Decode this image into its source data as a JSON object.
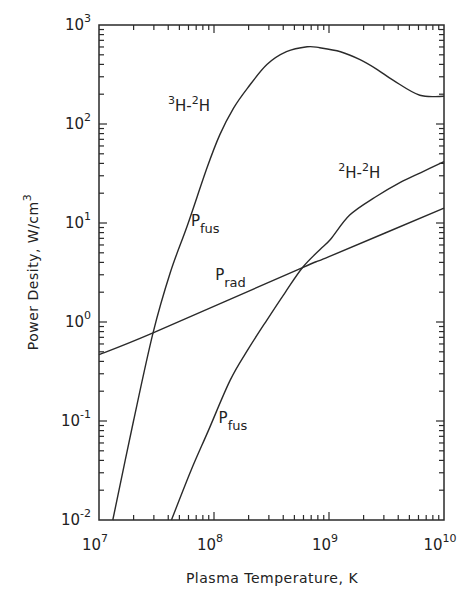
{
  "chart_data": {
    "type": "line",
    "title": "",
    "xlabel": "Plasma Temperature, K",
    "ylabel": "Power Desity, W/cm",
    "ylabel_sup": "3",
    "xscale": "log",
    "yscale": "log",
    "xlim_log10": [
      7,
      10
    ],
    "ylim_log10": [
      -2,
      3
    ],
    "x_ticks": [
      {
        "base": "10",
        "exp": "7",
        "log": 7
      },
      {
        "base": "10",
        "exp": "8",
        "log": 8
      },
      {
        "base": "10",
        "exp": "9",
        "log": 9
      },
      {
        "base": "10",
        "exp": "10",
        "log": 10
      }
    ],
    "y_ticks": [
      {
        "base": "10",
        "exp": "-2",
        "log": -2
      },
      {
        "base": "10",
        "exp": "-1",
        "log": -1
      },
      {
        "base": "10",
        "exp": "0",
        "log": 0
      },
      {
        "base": "10",
        "exp": "1",
        "log": 1
      },
      {
        "base": "10",
        "exp": "2",
        "log": 2
      },
      {
        "base": "10",
        "exp": "3",
        "log": 3
      }
    ],
    "grid": false,
    "series": [
      {
        "name": "3H-2H Pfus",
        "log10_x": [
          7.12,
          7.3,
          7.47,
          7.62,
          7.77,
          7.94,
          8.05,
          8.17,
          8.29,
          8.46,
          8.63,
          8.81,
          8.92,
          9.1,
          9.27,
          9.42,
          9.56,
          9.79,
          10.0
        ],
        "log10_y": [
          -2.0,
          -1.0,
          -0.11,
          0.5,
          0.98,
          1.56,
          1.89,
          2.16,
          2.36,
          2.6,
          2.73,
          2.78,
          2.77,
          2.73,
          2.65,
          2.55,
          2.44,
          2.29,
          2.28
        ]
      },
      {
        "name": "2H-2H Pfus",
        "log10_x": [
          7.63,
          7.8,
          7.95,
          8.14,
          8.3,
          8.46,
          8.62,
          8.77,
          8.92,
          9.01,
          9.18,
          9.4,
          9.62,
          9.8,
          10.0
        ],
        "log10_y": [
          -2.0,
          -1.5,
          -1.1,
          -0.59,
          -0.27,
          0.02,
          0.3,
          0.55,
          0.73,
          0.83,
          1.08,
          1.26,
          1.41,
          1.51,
          1.62
        ]
      },
      {
        "name": "Prad",
        "log10_x": [
          7.0,
          7.47,
          8.77,
          9.0,
          10.0
        ],
        "log10_y": [
          -0.33,
          -0.11,
          0.55,
          0.66,
          1.15
        ]
      }
    ],
    "annotations": [
      {
        "id": "dt-label",
        "pre": "3",
        "a": "H-",
        "pre2": "2",
        "b": "H",
        "log10_x": 7.6,
        "log10_y": 2.13
      },
      {
        "id": "dt-pfus",
        "main": "P",
        "sub": "fus",
        "log10_x": 7.8,
        "log10_y": 0.97
      },
      {
        "id": "prad",
        "main": "P",
        "sub": "rad",
        "log10_x": 8.01,
        "log10_y": 0.42
      },
      {
        "id": "dd-label",
        "pre": "2",
        "a": "H-",
        "pre2": "2",
        "b": "H",
        "log10_x": 9.08,
        "log10_y": 1.45
      },
      {
        "id": "dd-pfus",
        "main": "P",
        "sub": "fus",
        "log10_x": 8.04,
        "log10_y": -1.02
      }
    ]
  }
}
